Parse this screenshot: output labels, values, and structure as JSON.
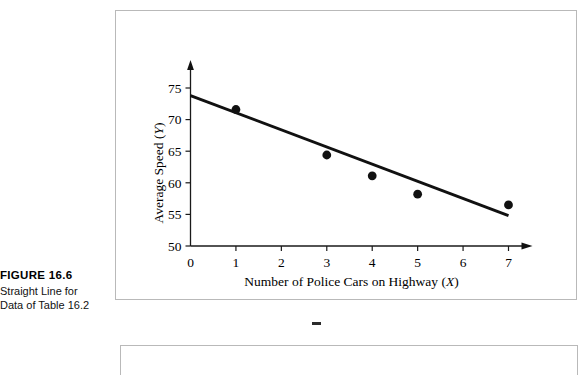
{
  "figure": {
    "caption_title": "FIGURE 16.6",
    "caption_lines": [
      "Straight Line for",
      "Data of Table 16.2"
    ]
  },
  "chart_data": {
    "type": "scatter",
    "title": "",
    "xlabel": "Number of Police Cars on Highway (X)",
    "ylabel": "Average Speed (Y)",
    "xlabel_text": "Number of Police Cars on Highway",
    "xlabel_symbol": "X",
    "ylabel_text": "Average Speed",
    "ylabel_symbol": "Y",
    "xlim": [
      0,
      7
    ],
    "ylim": [
      50,
      75
    ],
    "xticks": [
      0,
      1,
      2,
      3,
      4,
      5,
      6,
      7
    ],
    "yticks": [
      50,
      55,
      60,
      65,
      70,
      75
    ],
    "xticklabels": [
      "0",
      "1",
      "2",
      "3",
      "4",
      "5",
      "6",
      "7"
    ],
    "yticklabels": [
      "50",
      "55",
      "60",
      "65",
      "70",
      "75"
    ],
    "grid": false,
    "legend": false,
    "x": [
      1,
      3,
      4,
      5,
      7
    ],
    "y": [
      71.6,
      64.4,
      61.1,
      58.2,
      56.5
    ],
    "points": [
      {
        "x": 1,
        "y": 71.6
      },
      {
        "x": 3,
        "y": 64.4
      },
      {
        "x": 4,
        "y": 61.1
      },
      {
        "x": 5,
        "y": 58.2
      },
      {
        "x": 7,
        "y": 56.5
      }
    ],
    "fit_line": {
      "name": "regression line",
      "x_start": 0,
      "y_start": 73.8,
      "x_end": 7,
      "y_end": 54.8
    }
  },
  "colors": {
    "ink": "#111111",
    "frame": "#b9b9b9",
    "background": "#ffffff"
  }
}
